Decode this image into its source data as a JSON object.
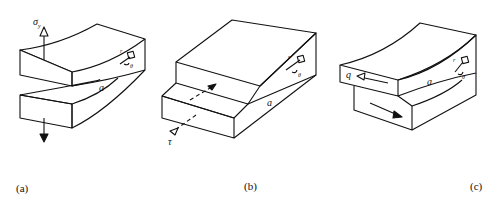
{
  "figure": {
    "panels": [
      {
        "id": "a",
        "caption": "(a)",
        "load_symbol": "σ",
        "load_subscript": "y",
        "crack_label": "a",
        "local_coords": {
          "r": "r",
          "theta": "θ"
        },
        "mode": "opening"
      },
      {
        "id": "b",
        "caption": "(b)",
        "load_symbol": "τ",
        "crack_label": "a",
        "local_coords": {
          "r": "r",
          "theta": "θ"
        },
        "mode": "sliding"
      },
      {
        "id": "c",
        "caption": "(c)",
        "load_symbol": "q",
        "crack_label": "a",
        "local_coords": {
          "r": "r",
          "theta": "θ"
        },
        "mode": "tearing"
      }
    ],
    "colors": {
      "stroke": "#111111",
      "background": "#ffffff"
    }
  }
}
